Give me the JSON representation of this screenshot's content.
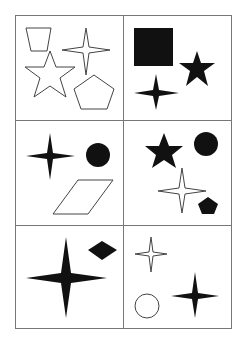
{
  "figure": {
    "type": "shape-grid-puzzle",
    "rows": 3,
    "cols": 2,
    "line_color": "#777777",
    "fill_color": "#111111",
    "stroke_color": "#444444",
    "cells": [
      {
        "id": "cell-r1c1",
        "shapes": [
          {
            "kind": "trapezoid",
            "style": "outline"
          },
          {
            "kind": "four-point-star",
            "style": "outline"
          },
          {
            "kind": "five-point-star",
            "style": "outline"
          },
          {
            "kind": "pentagon",
            "style": "outline"
          }
        ]
      },
      {
        "id": "cell-r1c2",
        "shapes": [
          {
            "kind": "square",
            "style": "filled"
          },
          {
            "kind": "five-point-star",
            "style": "filled"
          },
          {
            "kind": "four-point-star",
            "style": "filled"
          }
        ]
      },
      {
        "id": "cell-r2c1",
        "shapes": [
          {
            "kind": "four-point-star",
            "style": "filled"
          },
          {
            "kind": "circle",
            "style": "filled"
          },
          {
            "kind": "parallelogram",
            "style": "outline"
          }
        ]
      },
      {
        "id": "cell-r2c2",
        "shapes": [
          {
            "kind": "five-point-star",
            "style": "filled"
          },
          {
            "kind": "circle",
            "style": "filled"
          },
          {
            "kind": "four-point-star",
            "style": "outline"
          },
          {
            "kind": "pentagon",
            "style": "filled"
          }
        ]
      },
      {
        "id": "cell-r3c1",
        "shapes": [
          {
            "kind": "four-point-star",
            "style": "filled",
            "size": "large"
          },
          {
            "kind": "diamond",
            "style": "filled"
          }
        ]
      },
      {
        "id": "cell-r3c2",
        "shapes": [
          {
            "kind": "four-point-star",
            "style": "outline"
          },
          {
            "kind": "circle",
            "style": "outline"
          },
          {
            "kind": "four-point-star",
            "style": "filled"
          }
        ]
      }
    ]
  }
}
